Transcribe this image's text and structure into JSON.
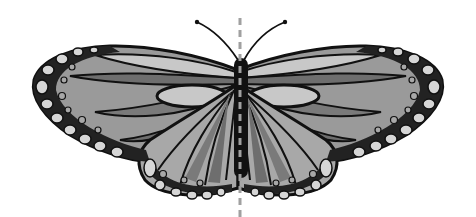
{
  "figure": {
    "style": "grayscale illustration",
    "symmetry_line": "vertical dashed axis of symmetry",
    "colors": {
      "background": "#ffffff",
      "outline": "#111111",
      "light": "#c8c8c8",
      "mid": "#9a9a9a",
      "dark": "#6e6e6e",
      "spot_light": "#d6d6d6",
      "spot_mid": "#a8a8a8",
      "axis": "#a0a0a0"
    }
  }
}
